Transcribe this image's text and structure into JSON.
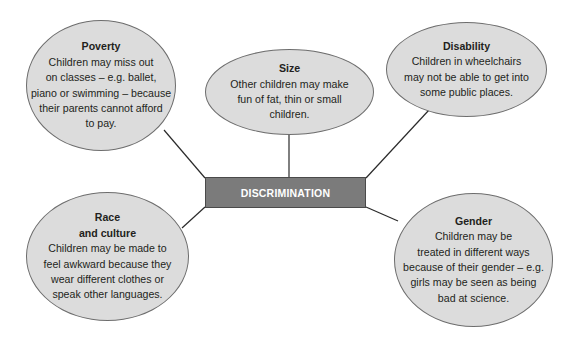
{
  "diagram": {
    "type": "mind-map",
    "center": {
      "label": "DISCRIMINATION",
      "fill": "#7b7b7b",
      "text_color": "#ffffff"
    },
    "bubble_fill": "#dcdcdc",
    "nodes": [
      {
        "id": "poverty",
        "title": "Poverty",
        "body": "Children may miss out\non classes – e.g. ballet,\npiano or swimming – because\ntheir parents cannot afford\nto pay."
      },
      {
        "id": "size",
        "title": "Size",
        "body": "Other children may make\nfun of fat, thin or small\nchildren."
      },
      {
        "id": "disability",
        "title": "Disability",
        "body": "Children in wheelchairs\nmay not be able to get into\nsome public places."
      },
      {
        "id": "race-culture",
        "title": "Race\nand culture",
        "body": "Children may be made to\nfeel awkward because they\nwear different clothes or\nspeak other languages."
      },
      {
        "id": "gender",
        "title": "Gender",
        "body": "Children may be\ntreated in different ways\nbecause of their gender – e.g.\ngirls may be seen as being\nbad at science."
      }
    ]
  }
}
